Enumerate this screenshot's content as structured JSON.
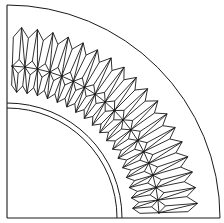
{
  "figure": {
    "width": 224,
    "height": 223,
    "center": [
      7,
      218
    ],
    "stroke_color": "#1a1a1a",
    "background": "#ffffff",
    "frame": {
      "left_x": 7,
      "bottom_y": 218
    },
    "arcs": [
      {
        "name": "outer-boundary-arc",
        "radius": 213
      },
      {
        "name": "inner-arc-outer",
        "radius": 115
      },
      {
        "name": "inner-arc-inner",
        "radius": 110
      }
    ],
    "crystal_ring": {
      "count": 18,
      "inner_peak_radius": 126,
      "inner_valley_radius": 133,
      "mid_radius": 152,
      "outer_valley_radius": 181,
      "outer_peak_radius": 191,
      "start_angle_deg": 2,
      "end_angle_deg": 88
    }
  }
}
